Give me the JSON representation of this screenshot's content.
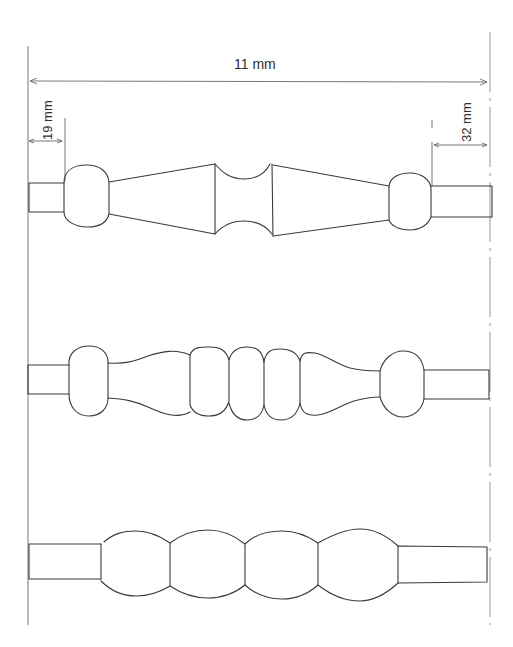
{
  "figure": {
    "dimensions": {
      "overall_length": "11 mm",
      "left_tube_length": "19 mm",
      "right_tube_length": "32 mm"
    },
    "beads": [
      {
        "id": "bead-1",
        "style": "ball-cone-waist-cone-ball"
      },
      {
        "id": "bead-2",
        "style": "ball-flare-three-rings-flare-ball"
      },
      {
        "id": "bead-3",
        "style": "four-lobed-segments"
      }
    ],
    "colors": {
      "ink": "#3a3a3a",
      "background": "#ffffff"
    }
  }
}
